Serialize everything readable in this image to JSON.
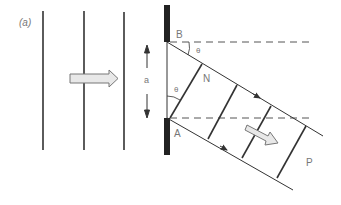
{
  "figure": {
    "panel_label": "(a)",
    "labels": {
      "B": "B",
      "A": "A",
      "N": "N",
      "P": "P",
      "theta_top": "θ",
      "theta_mid": "θ",
      "slit_width": "a"
    }
  },
  "colors": {
    "line": "#333333",
    "screen": "#222222",
    "dashed": "#555555",
    "arrow_fill": "#e6e6e6",
    "arrow_stroke": "#777777",
    "label": "#777777"
  }
}
